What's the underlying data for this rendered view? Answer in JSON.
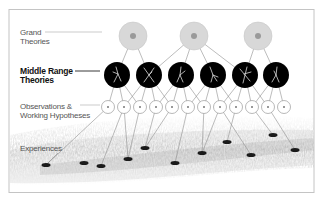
{
  "diagram": {
    "levels": [
      {
        "id": "grand",
        "label_line1": "Grand",
        "label_line2": "Theories",
        "bold": false
      },
      {
        "id": "middle",
        "label_line1": "Middle Range",
        "label_line2": "Theories",
        "bold": true
      },
      {
        "id": "observations",
        "label_line1": "Observations &",
        "label_line2": "Working Hypotheses",
        "bold": false
      },
      {
        "id": "experiences",
        "label_line1": "Experiences",
        "label_line2": "",
        "bold": false
      }
    ],
    "grand_nodes": [
      {
        "x": 133,
        "y": 36
      },
      {
        "x": 194,
        "y": 36
      },
      {
        "x": 258,
        "y": 36
      }
    ],
    "middle_nodes": [
      {
        "x": 117,
        "y": 75
      },
      {
        "x": 149,
        "y": 75
      },
      {
        "x": 181,
        "y": 75
      },
      {
        "x": 213,
        "y": 75
      },
      {
        "x": 245,
        "y": 75
      },
      {
        "x": 276,
        "y": 75
      }
    ],
    "observation_nodes": [
      {
        "x": 108
      },
      {
        "x": 124
      },
      {
        "x": 140
      },
      {
        "x": 156
      },
      {
        "x": 172
      },
      {
        "x": 188
      },
      {
        "x": 204
      },
      {
        "x": 220
      },
      {
        "x": 236
      },
      {
        "x": 252
      },
      {
        "x": 268
      },
      {
        "x": 284
      }
    ],
    "experience_points": [
      {
        "x": 46,
        "y": 165
      },
      {
        "x": 84,
        "y": 163
      },
      {
        "x": 101,
        "y": 166
      },
      {
        "x": 128,
        "y": 159
      },
      {
        "x": 145,
        "y": 148
      },
      {
        "x": 175,
        "y": 163
      },
      {
        "x": 202,
        "y": 153
      },
      {
        "x": 227,
        "y": 142
      },
      {
        "x": 251,
        "y": 155
      },
      {
        "x": 273,
        "y": 135
      },
      {
        "x": 295,
        "y": 150
      }
    ],
    "colors": {
      "grand_fill": "#d8d8d8",
      "grand_center": "#9a9a9a",
      "middle_fill": "#000000",
      "line": "#9a9a9a",
      "frame": "#bdbdbd"
    }
  }
}
